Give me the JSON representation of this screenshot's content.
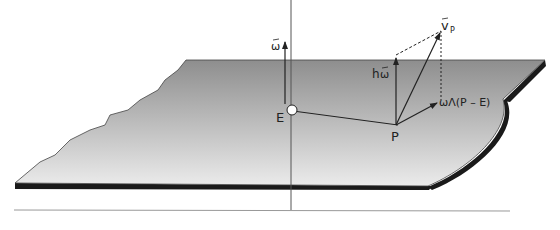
{
  "diagram": {
    "labels": {
      "omega": "ω",
      "E": "E",
      "P": "P",
      "h_omega_h": "h",
      "h_omega_w": "ω",
      "v": "v",
      "v_sub": "P",
      "cross": "ωΛ(P – E)"
    },
    "colors": {
      "plane_top": "#8f8f8f",
      "plane_bottom": "#e6e6e6",
      "edge": "#1a1a1a",
      "line": "#333333",
      "separator": "#9a9a9a"
    }
  }
}
